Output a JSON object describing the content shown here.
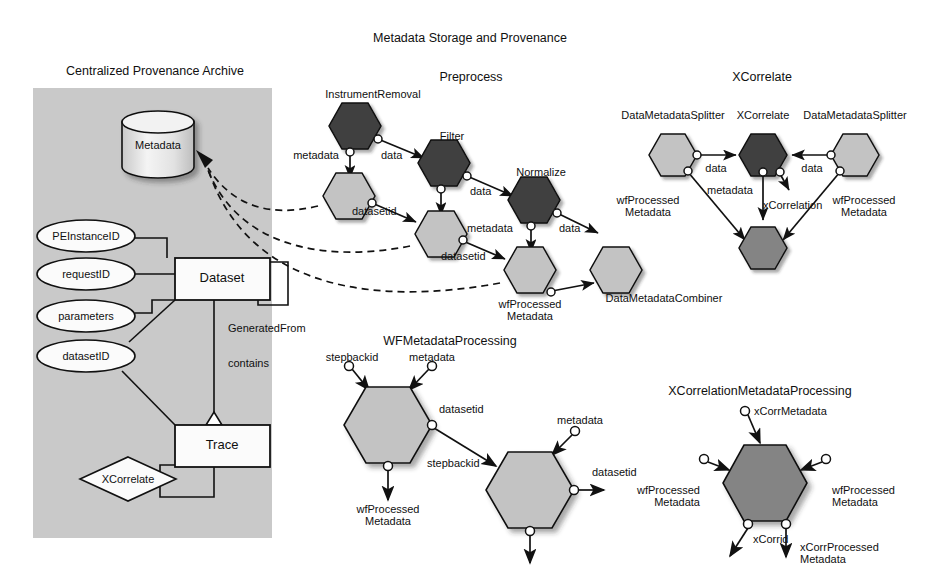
{
  "page": {
    "title": "Metadata Storage and Provenance",
    "title_pos": {
      "x": 470,
      "y": 31
    }
  },
  "colors": {
    "panel_fill": "#c9c9c9",
    "hex_dark": "#3f3f3f",
    "hex_medium": "#848484",
    "hex_light": "#c3c3c3",
    "stroke": "#111111",
    "cylinder_fill": "#e8e8e8",
    "shape_fill": "#fbfbfb"
  },
  "sections": [
    {
      "name": "centralized-provenance-archive",
      "label": "Centralized Provenance Archive",
      "x": 155,
      "y": 64
    },
    {
      "name": "preprocess",
      "label": "Preprocess",
      "x": 471,
      "y": 70
    },
    {
      "name": "xcorrelate",
      "label": "XCorrelate",
      "x": 762,
      "y": 70
    },
    {
      "name": "wfmetadataprocessing",
      "label": "WFMetadataProcessing",
      "x": 450,
      "y": 334
    },
    {
      "name": "xcorrelationmetadataprocessing",
      "label": "XCorrelationMetadataProcessing",
      "x": 760,
      "y": 384
    }
  ],
  "archive": {
    "panel": {
      "x": 33,
      "y": 88,
      "w": 239,
      "h": 450
    },
    "datastore": {
      "label": "Metadata",
      "cx": 158,
      "cy": 145,
      "rx": 36,
      "ry": 11,
      "h": 52
    },
    "attributes": [
      {
        "name": "peinstanceid",
        "label": "PEInstanceID",
        "cx": 86,
        "cy": 236,
        "rx": 49,
        "ry": 16
      },
      {
        "name": "requestid",
        "label": "requestID",
        "cx": 86,
        "cy": 274,
        "rx": 49,
        "ry": 16
      },
      {
        "name": "parameters",
        "label": "parameters",
        "cx": 86,
        "cy": 316,
        "rx": 49,
        "ry": 16
      },
      {
        "name": "datasetid",
        "label": "datasetID",
        "cx": 86,
        "cy": 356,
        "rx": 49,
        "ry": 16
      }
    ],
    "entities": [
      {
        "name": "dataset",
        "label": "Dataset",
        "x": 175,
        "y": 258,
        "w": 95,
        "h": 42
      },
      {
        "name": "trace",
        "label": "Trace",
        "x": 175,
        "y": 425,
        "w": 95,
        "h": 42
      }
    ],
    "relationships": [
      {
        "name": "xcorrelate-relationship",
        "label": "XCorrelate",
        "cx": 128,
        "cy": 479,
        "rx": 48,
        "ry": 22
      }
    ],
    "edge_labels": [
      {
        "name": "generatedfrom-label",
        "label": "GeneratedFrom",
        "x": 228,
        "y": 328
      },
      {
        "name": "contains-label",
        "label": "contains",
        "x": 228,
        "y": 363
      }
    ]
  },
  "preprocess": {
    "nodes": [
      {
        "name": "instrumentremoval",
        "label": "InstrumentRemoval",
        "cx": 355,
        "cy": 126,
        "r": 26,
        "tone": "dark",
        "label_x": 373,
        "label_y": 88
      },
      {
        "name": "filter",
        "label": "Filter",
        "cx": 444,
        "cy": 163,
        "r": 26,
        "tone": "dark",
        "label_x": 452,
        "label_y": 130
      },
      {
        "name": "normalize",
        "label": "Normalize",
        "cx": 534,
        "cy": 200,
        "r": 26,
        "tone": "dark",
        "label_x": 541,
        "label_y": 166
      },
      {
        "name": "wfmeta-node-1",
        "label": "",
        "cx": 349,
        "cy": 196,
        "r": 26,
        "tone": "light"
      },
      {
        "name": "wfmeta-node-2",
        "label": "",
        "cx": 441,
        "cy": 234,
        "r": 26,
        "tone": "light"
      },
      {
        "name": "wfmeta-node-3",
        "label": "wfProcessed\nMetadata",
        "cx": 530,
        "cy": 270,
        "r": 26,
        "tone": "light",
        "label_x": 530,
        "label_y": 300
      },
      {
        "name": "datametadatacombiner",
        "label": "DataMetadataCombiner",
        "cx": 616,
        "cy": 270,
        "r": 26,
        "tone": "light",
        "label_x": 664,
        "label_y": 298
      }
    ],
    "port_labels": [
      {
        "name": "port-metadata-1",
        "label": "metadata",
        "x": 336,
        "y": 153,
        "align": "r"
      },
      {
        "name": "port-data-1",
        "label": "data",
        "x": 397,
        "y": 154,
        "align": "l"
      },
      {
        "name": "port-datasetid-1",
        "label": "datasetid",
        "x": 355,
        "y": 212,
        "align": "l"
      },
      {
        "name": "port-data-2",
        "label": "data",
        "x": 479,
        "y": 188,
        "align": "l"
      },
      {
        "name": "port-datasetid-2",
        "label": "datasetid",
        "x": 447,
        "y": 257,
        "align": "l"
      },
      {
        "name": "port-metadata-2",
        "label": "metadata",
        "x": 472,
        "y": 228,
        "align": "l"
      },
      {
        "name": "port-data-3",
        "label": "data",
        "x": 568,
        "y": 228,
        "align": "l"
      }
    ]
  },
  "xcorrelate": {
    "nodes": [
      {
        "name": "datametadatasplitter-left",
        "label": "DataMetadataSplitter",
        "cx": 673,
        "cy": 155,
        "r": 24,
        "tone": "light",
        "label_x": 673,
        "label_y": 115
      },
      {
        "name": "xcorrelate-node",
        "label": "XCorrelate",
        "cx": 763,
        "cy": 155,
        "r": 24,
        "tone": "dark",
        "label_x": 763,
        "label_y": 115
      },
      {
        "name": "datametadatasplitter-right",
        "label": "DataMetadataSplitter",
        "cx": 855,
        "cy": 155,
        "r": 24,
        "tone": "light",
        "label_x": 855,
        "label_y": 115
      },
      {
        "name": "combiner-node",
        "label": "",
        "cx": 763,
        "cy": 248,
        "r": 24,
        "tone": "medium"
      }
    ],
    "port_labels": [
      {
        "name": "xc-data-left",
        "label": "data",
        "x": 718,
        "y": 167,
        "align": "c"
      },
      {
        "name": "xc-data-right",
        "label": "data",
        "x": 812,
        "y": 167,
        "align": "c"
      },
      {
        "name": "xc-metadata",
        "label": "metadata",
        "x": 721,
        "y": 190,
        "align": "l"
      },
      {
        "name": "xc-xcorrelation",
        "label": "xCorrelation",
        "x": 765,
        "y": 205,
        "align": "l"
      },
      {
        "name": "xc-wfprocessed-left",
        "label": "wfProcessed\nMetadata",
        "x": 636,
        "y": 198,
        "align": "l"
      },
      {
        "name": "xc-wfprocessed-right",
        "label": "wfProcessed\nMetadata",
        "x": 823,
        "y": 198,
        "align": "l"
      }
    ]
  },
  "wfmetadataprocessing": {
    "nodes": [
      {
        "name": "wf-node-left",
        "label": "",
        "cx": 388,
        "cy": 425,
        "r": 45,
        "tone": "light"
      },
      {
        "name": "wf-node-right",
        "label": "",
        "cx": 530,
        "cy": 490,
        "r": 45,
        "tone": "light"
      }
    ],
    "port_labels": [
      {
        "name": "wf-stepbackid-in",
        "label": "stepbackid",
        "x": 352,
        "y": 355,
        "align": "c"
      },
      {
        "name": "wf-metadata-in",
        "label": "metadata",
        "x": 430,
        "y": 355,
        "align": "c"
      },
      {
        "name": "wf-datasetid-1",
        "label": "datasetid",
        "x": 438,
        "y": 409,
        "align": "l"
      },
      {
        "name": "wf-stepbackid-2",
        "label": "stepbackid",
        "x": 427,
        "y": 463,
        "align": "l"
      },
      {
        "name": "wf-wfprocessed-out",
        "label": "wfProcessed\nMetadata",
        "x": 388,
        "y": 505,
        "align": "c"
      },
      {
        "name": "wf-metadata-in-2",
        "label": "metadata",
        "x": 573,
        "y": 420,
        "align": "c"
      },
      {
        "name": "wf-datasetid-out",
        "label": "datasetid",
        "x": 600,
        "y": 471,
        "align": "l"
      }
    ]
  },
  "xcorrelationmetadataprocessing": {
    "nodes": [
      {
        "name": "xcorr-node",
        "label": "",
        "cx": 765,
        "cy": 483,
        "r": 42,
        "tone": "medium"
      }
    ],
    "port_labels": [
      {
        "name": "xcorr-xcorrmetadata",
        "label": "xCorrMetadata",
        "x": 752,
        "y": 407,
        "align": "l"
      },
      {
        "name": "xcorr-wfprocessed-left",
        "label": "wfProcessed\nMetadata",
        "x": 700,
        "y": 490,
        "align": "r"
      },
      {
        "name": "xcorr-wfprocessed-right",
        "label": "wfProcessed\nMetadata",
        "x": 833,
        "y": 490,
        "align": "l"
      },
      {
        "name": "xcorr-xcorrid",
        "label": "xCorrid",
        "x": 752,
        "y": 539,
        "align": "l"
      },
      {
        "name": "xcorr-xcorrprocessed",
        "label": "xCorrProcessed\nMetadata",
        "x": 810,
        "y": 539,
        "align": "l"
      }
    ]
  }
}
